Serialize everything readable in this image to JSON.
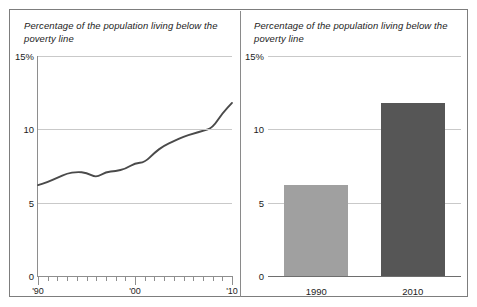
{
  "figure": {
    "panels": [
      {
        "id": "line-panel",
        "title": "Percentage of the population living below the poverty line",
        "type": "line"
      },
      {
        "id": "bar-panel",
        "title": "Percentage of the population living below the poverty line",
        "type": "bar"
      }
    ]
  },
  "colors": {
    "line": "#4a4a4a",
    "grid": "#c9c9c9",
    "axis": "#7d7d7d",
    "bar_1990": "#a0a0a0",
    "bar_2010": "#565656",
    "frame": "#7d7d7d",
    "text": "#1c1c1c"
  },
  "axis": {
    "y_ticks": [
      {
        "label": "15%",
        "value": 15
      },
      {
        "label": "10",
        "value": 10
      },
      {
        "label": "5",
        "value": 5
      },
      {
        "label": "0",
        "value": 0
      }
    ],
    "y_min": 0,
    "y_max": 15,
    "x_ticks_labels": [
      {
        "label": "'90",
        "value": 1990
      },
      {
        "label": "'00",
        "value": 2000
      },
      {
        "label": "'10",
        "value": 2010
      }
    ]
  },
  "chart_data": [
    {
      "type": "line",
      "title": "Percentage of the population living below the poverty line",
      "xlabel": "",
      "ylabel": "",
      "ylim": [
        0,
        15
      ],
      "xlim": [
        1990,
        2010
      ],
      "grid": true,
      "legend": "none",
      "x": [
        1990,
        1991,
        1992,
        1993,
        1994,
        1995,
        1996,
        1997,
        1998,
        1999,
        2000,
        2001,
        2002,
        2003,
        2004,
        2005,
        2006,
        2007,
        2008,
        2009,
        2010
      ],
      "values": [
        6.2,
        6.4,
        6.7,
        7.0,
        7.1,
        7.05,
        6.7,
        7.1,
        7.15,
        7.3,
        7.7,
        7.75,
        8.4,
        8.9,
        9.2,
        9.5,
        9.7,
        9.9,
        10.1,
        11.1,
        11.8
      ],
      "series": [
        {
          "name": "Percentage of population below poverty line",
          "values": [
            6.2,
            6.4,
            6.7,
            7.0,
            7.1,
            7.05,
            6.7,
            7.1,
            7.15,
            7.3,
            7.7,
            7.75,
            8.4,
            8.9,
            9.2,
            9.5,
            9.7,
            9.9,
            10.1,
            11.1,
            11.8
          ]
        }
      ]
    },
    {
      "type": "bar",
      "title": "Percentage of the population living below the poverty line",
      "xlabel": "",
      "ylabel": "",
      "ylim": [
        0,
        15
      ],
      "grid": true,
      "legend": "none",
      "categories": [
        "1990",
        "2010"
      ],
      "values": [
        6.2,
        11.8
      ]
    }
  ]
}
